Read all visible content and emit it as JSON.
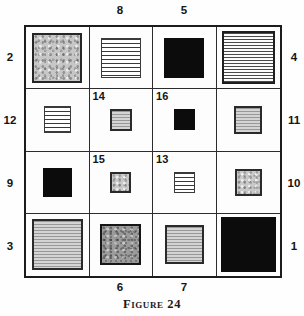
{
  "figure": {
    "caption": "Figure 24",
    "colors": {
      "ink": "#1c1c1c",
      "paper": "#fefefe",
      "solid_fill": "#0c0c0c",
      "gray_fill": "#c7c7c7",
      "dark_gray_fill": "#9b9b9b"
    }
  },
  "labels": {
    "top": [
      "8",
      "5"
    ],
    "bottom": [
      "6",
      "7"
    ],
    "left": [
      "2",
      "12",
      "9",
      "3"
    ],
    "right": [
      "4",
      "11",
      "10",
      "1"
    ]
  },
  "grid": {
    "rows": 4,
    "cols": 4,
    "cells": [
      {
        "row": 1,
        "col": 1,
        "label": "",
        "fill": "stipple",
        "size_px": 50
      },
      {
        "row": 1,
        "col": 2,
        "label": "",
        "fill": "hlines",
        "size_px": 40
      },
      {
        "row": 1,
        "col": 3,
        "label": "",
        "fill": "black",
        "size_px": 40
      },
      {
        "row": 1,
        "col": 4,
        "label": "",
        "fill": "hlines-fine",
        "size_px": 53
      },
      {
        "row": 2,
        "col": 1,
        "label": "",
        "fill": "hlines",
        "size_px": 27
      },
      {
        "row": 2,
        "col": 2,
        "label": "14",
        "fill": "gray-lines",
        "size_px": 22
      },
      {
        "row": 2,
        "col": 3,
        "label": "16",
        "fill": "black",
        "size_px": 21
      },
      {
        "row": 2,
        "col": 4,
        "label": "",
        "fill": "gray-lines",
        "size_px": 28
      },
      {
        "row": 3,
        "col": 1,
        "label": "",
        "fill": "black",
        "size_px": 29
      },
      {
        "row": 3,
        "col": 2,
        "label": "15",
        "fill": "stipple-light",
        "size_px": 21
      },
      {
        "row": 3,
        "col": 3,
        "label": "13",
        "fill": "hlines",
        "size_px": 21
      },
      {
        "row": 3,
        "col": 4,
        "label": "",
        "fill": "stipple-light",
        "size_px": 27
      },
      {
        "row": 4,
        "col": 1,
        "label": "",
        "fill": "gray-lines",
        "size_px": 51
      },
      {
        "row": 4,
        "col": 2,
        "label": "",
        "fill": "stipple-dark",
        "size_px": 41
      },
      {
        "row": 4,
        "col": 3,
        "label": "",
        "fill": "gray-lines",
        "size_px": 39
      },
      {
        "row": 4,
        "col": 4,
        "label": "",
        "fill": "black",
        "size_px": 55
      }
    ]
  }
}
